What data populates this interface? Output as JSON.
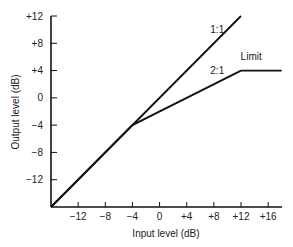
{
  "chart_data": {
    "type": "line",
    "title": "",
    "xlabel": "Input level (dB)",
    "ylabel": "Output level (dB)",
    "xlim": [
      -16,
      18
    ],
    "ylim": [
      -16,
      12
    ],
    "grid": false,
    "legend": "none",
    "x_ticks": [
      -12,
      -8,
      -4,
      0,
      4,
      8,
      12,
      16
    ],
    "x_tick_labels": [
      "−12",
      "−8",
      "−4",
      "0",
      "+4",
      "+8",
      "+12",
      "+16"
    ],
    "y_ticks": [
      12,
      8,
      4,
      0,
      -4,
      -8,
      -12
    ],
    "y_tick_labels": [
      "+12",
      "+8",
      "+4",
      "0",
      "−4",
      "−8",
      "−12"
    ],
    "series": [
      {
        "name": "1:1",
        "x": [
          -16,
          12
        ],
        "y": [
          -16,
          12
        ]
      },
      {
        "name": "2:1",
        "x": [
          -16,
          -4,
          12
        ],
        "y": [
          -16,
          -4,
          4
        ]
      },
      {
        "name": "Limit",
        "x": [
          12,
          18
        ],
        "y": [
          4,
          4
        ]
      }
    ],
    "annotations": [
      {
        "text": "1:1",
        "x": 8.5,
        "y": 9.5
      },
      {
        "text": "2:1",
        "x": 8.5,
        "y": 3.5
      },
      {
        "text": "Limit",
        "x": 13.5,
        "y": 5.5
      }
    ]
  }
}
